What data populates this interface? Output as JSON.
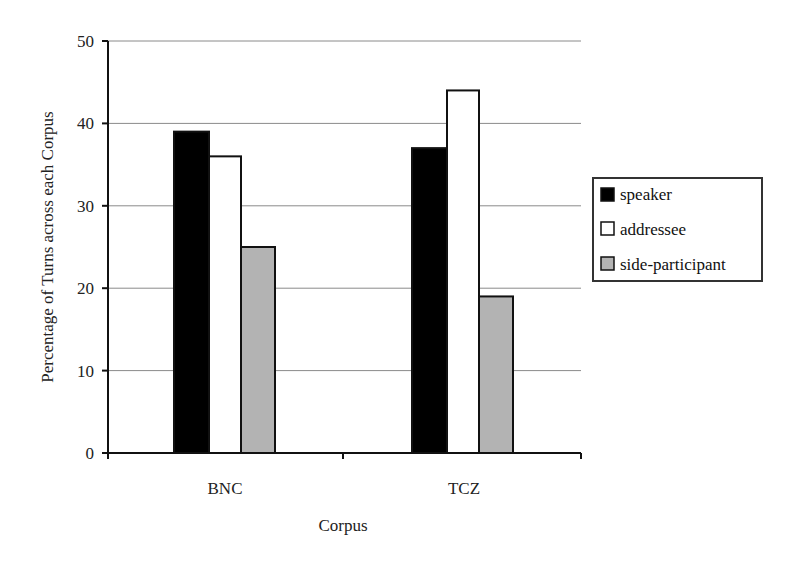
{
  "chart_data": {
    "type": "bar",
    "title": "",
    "xlabel": "Corpus",
    "ylabel": "Percentage of Turns across each Corpus",
    "categories": [
      "BNC",
      "TCZ"
    ],
    "series": [
      {
        "name": "speaker",
        "values": [
          39,
          37
        ],
        "color": "#000000"
      },
      {
        "name": "addressee",
        "values": [
          36,
          44
        ],
        "color": "#ffffff"
      },
      {
        "name": "side-participant",
        "values": [
          25,
          19
        ],
        "color": "#b3b3b3"
      }
    ],
    "ylim": [
      0,
      50
    ],
    "yticks": [
      0,
      10,
      20,
      30,
      40,
      50
    ],
    "grid": true,
    "legend_position": "right"
  },
  "axis": {
    "y_title": "Percentage of Turns across each Corpus",
    "x_title": "Corpus",
    "y_ticks": [
      "0",
      "10",
      "20",
      "30",
      "40",
      "50"
    ],
    "x_labels": [
      "BNC",
      "TCZ"
    ]
  },
  "legend": {
    "items": [
      {
        "label": "speaker",
        "color": "#000000"
      },
      {
        "label": "addressee",
        "color": "#ffffff"
      },
      {
        "label": "side-participant",
        "color": "#b3b3b3"
      }
    ]
  }
}
